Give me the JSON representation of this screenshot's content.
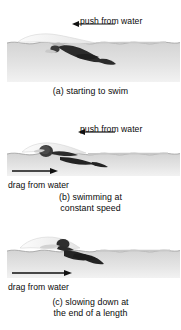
{
  "figure": {
    "type": "physics-force-diagram",
    "background_color": "#ffffff",
    "water_color_top": "#d8d8d8",
    "water_color_bottom": "#efefef",
    "swimmer_color": "#2e2e2e",
    "text_color": "#0a0a0a"
  },
  "panels": [
    {
      "id": "a",
      "caption": "(a) starting to swim",
      "forces": [
        {
          "name": "push-from-water",
          "label": "push from water",
          "direction": "left",
          "length": "long"
        }
      ]
    },
    {
      "id": "b",
      "caption_line1": "(b) swimming at",
      "caption_line2": "constant speed",
      "caption": "(b) swimming at constant speed",
      "forces": [
        {
          "name": "push-from-water",
          "label": "push from water",
          "direction": "left",
          "length": "medium"
        },
        {
          "name": "drag-from-water",
          "label": "drag from water",
          "direction": "right",
          "length": "medium"
        }
      ]
    },
    {
      "id": "c",
      "caption_line1": "(c) slowing down at",
      "caption_line2": "the end of a length",
      "caption": "(c) slowing down at the end of a length",
      "forces": [
        {
          "name": "drag-from-water",
          "label": "drag from water",
          "direction": "right",
          "length": "long"
        }
      ]
    }
  ]
}
